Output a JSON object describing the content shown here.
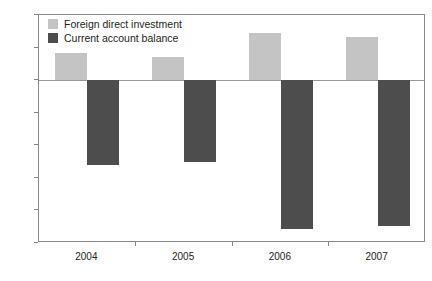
{
  "chart_data": {
    "type": "bar",
    "title": "",
    "subtitle": "",
    "xlabel": "",
    "ylabel": "",
    "categories": [
      "2004",
      "2005",
      "2006",
      "2007"
    ],
    "series": [
      {
        "name": "Foreign direct investment",
        "color": "#c4c4c4",
        "values": [
          4.2,
          3.6,
          7.3,
          6.6
        ]
      },
      {
        "name": "Current account balance",
        "color": "#4d4d4d",
        "values": [
          -13.0,
          -12.5,
          -22.9,
          -22.4
        ]
      }
    ],
    "ylim": [
      -25,
      10
    ],
    "yticks": [
      10,
      5,
      0,
      -5,
      -10,
      -15,
      -20,
      -25
    ],
    "ytick_labels": [
      "10",
      "5",
      "0",
      "-5",
      "-10",
      "-15",
      "-20",
      "-25"
    ],
    "grid": false,
    "zero_line": true,
    "legend_position": "top-left"
  },
  "axis": {
    "y_labels": [
      "10",
      "5",
      "0",
      "-5",
      "-10",
      "-15",
      "-20",
      "-25"
    ],
    "x_labels": [
      "2004",
      "2005",
      "2006",
      "2007"
    ]
  },
  "legend": {
    "items": [
      {
        "label": "Foreign direct investment",
        "swatch_name": "legend-swatch-fdi"
      },
      {
        "label": "Current account balance",
        "swatch_name": "legend-swatch-cab"
      }
    ]
  },
  "colors": {
    "fdi": "#c4c4c4",
    "cab": "#4d4d4d",
    "axis": "#8a8a8a",
    "text": "#231f20",
    "background": "#ffffff"
  }
}
